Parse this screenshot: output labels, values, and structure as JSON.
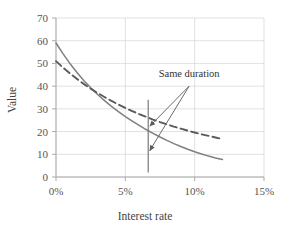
{
  "chart_data": {
    "type": "line",
    "title": "",
    "xlabel": "Interest rate",
    "ylabel": "Value",
    "xlim": [
      0,
      15
    ],
    "ylim": [
      0,
      70
    ],
    "grid": true,
    "legend": "none",
    "x_tick_labels": [
      "0%",
      "5%",
      "10%",
      "15%"
    ],
    "x_tick_values": [
      0,
      5,
      10,
      15
    ],
    "y_tick_labels": [
      "0",
      "10",
      "20",
      "30",
      "40",
      "50",
      "60",
      "70"
    ],
    "y_tick_values": [
      0,
      10,
      20,
      30,
      40,
      50,
      60,
      70
    ],
    "series": [
      {
        "name": "solid-bond",
        "style": "solid",
        "color": "#7f7f7f",
        "x": [
          0,
          0.5,
          1,
          1.5,
          2,
          2.5,
          3,
          3.5,
          4,
          4.5,
          5,
          5.5,
          6,
          6.5,
          7,
          7.5,
          8,
          8.5,
          9,
          9.5,
          10,
          10.5,
          11,
          11.5,
          12
        ],
        "y": [
          59,
          54.3,
          50,
          46.1,
          42.5,
          39.3,
          36.3,
          33.6,
          31.1,
          28.8,
          26.6,
          24.6,
          22.7,
          20.9,
          19.2,
          17.6,
          16.1,
          14.7,
          13.4,
          12.2,
          11.1,
          10.1,
          9.2,
          8.4,
          7.7
        ]
      },
      {
        "name": "dashed-bond",
        "style": "dashed",
        "color": "#5a5a5a",
        "x": [
          0,
          0.5,
          1,
          1.5,
          2,
          2.5,
          3,
          3.5,
          4,
          4.5,
          5,
          5.5,
          6,
          6.5,
          7,
          7.5,
          8,
          8.5,
          9,
          9.5,
          10,
          10.5,
          11,
          11.5,
          12
        ],
        "y": [
          51,
          48.2,
          45.6,
          43.2,
          41,
          38.9,
          37,
          35.2,
          33.5,
          31.9,
          30.4,
          29,
          27.7,
          26.5,
          25.3,
          24.2,
          23.2,
          22.2,
          21.3,
          20.4,
          19.6,
          18.8,
          18.1,
          17.4,
          16.7
        ]
      }
    ],
    "annotations": [
      {
        "name": "same-duration-label",
        "text": "Same duration",
        "x": 9.6,
        "y": 44
      },
      {
        "name": "duration-vertical-line",
        "x": 6.65,
        "y_top": 34,
        "y_bottom": 2
      },
      {
        "name": "arrow-to-dashed",
        "from_x": 9.6,
        "from_y": 40,
        "to_x": 6.75,
        "to_y": 22.3
      },
      {
        "name": "arrow-to-solid",
        "from_x": 9.6,
        "from_y": 40,
        "to_x": 6.75,
        "to_y": 11.5
      }
    ]
  }
}
